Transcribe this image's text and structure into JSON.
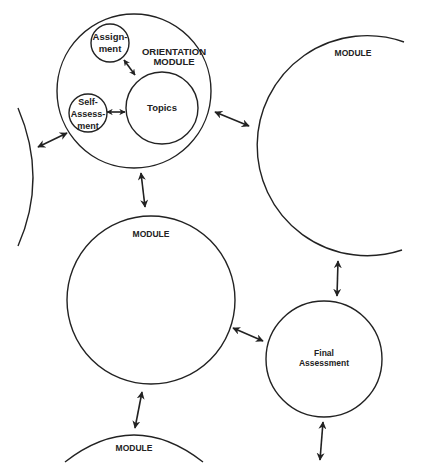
{
  "diagram": {
    "type": "course-module-network",
    "stroke_color": "#222222",
    "background": "#ffffff",
    "nodes": {
      "orientation": {
        "label_line1": "ORIENTATION",
        "label_line2": "MODULE"
      },
      "assignment": {
        "label_line1": "Assign-",
        "label_line2": "ment"
      },
      "self_assessment": {
        "label_line1": "Self-",
        "label_line2": "Assess-",
        "label_line3": "ment"
      },
      "topics": {
        "label": "Topics"
      },
      "module_right": {
        "label": "MODULE"
      },
      "module_middle": {
        "label": "MODULE"
      },
      "module_bottom": {
        "label": "MODULE"
      },
      "final_assessment": {
        "label_line1": "Final",
        "label_line2": "Assessment"
      },
      "module_left": {
        "label": ""
      }
    },
    "edges": [
      {
        "from": "assignment",
        "to": "topics",
        "type": "bidirectional"
      },
      {
        "from": "self_assessment",
        "to": "topics",
        "type": "bidirectional"
      },
      {
        "from": "module_left",
        "to": "orientation",
        "type": "bidirectional"
      },
      {
        "from": "orientation",
        "to": "module_right",
        "type": "bidirectional"
      },
      {
        "from": "orientation",
        "to": "module_middle",
        "type": "bidirectional"
      },
      {
        "from": "module_right",
        "to": "final_assessment",
        "type": "bidirectional"
      },
      {
        "from": "module_middle",
        "to": "final_assessment",
        "type": "bidirectional"
      },
      {
        "from": "module_middle",
        "to": "module_bottom",
        "type": "bidirectional"
      },
      {
        "from": "final_assessment",
        "to": "offscreen",
        "type": "bidirectional"
      }
    ]
  }
}
